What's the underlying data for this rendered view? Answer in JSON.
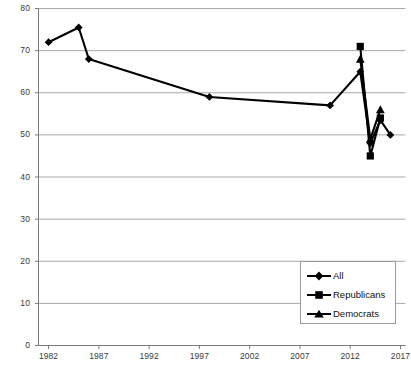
{
  "chart_data": {
    "type": "line",
    "title": "",
    "subtitle": "",
    "xlabel": "",
    "ylabel": "",
    "xlim": [
      1981.0,
      2017.5
    ],
    "ylim": [
      0,
      80
    ],
    "grid": true,
    "grid_axis": "y",
    "legend_position": "bottom-right",
    "x_ticks": [
      1982,
      1987,
      1992,
      1997,
      2002,
      2007,
      2012,
      2017
    ],
    "x_tick_labels": [
      "1982",
      "1987",
      "1992",
      "1997",
      "2002",
      "2007",
      "2012",
      "2017"
    ],
    "y_ticks": [
      0,
      10,
      20,
      30,
      40,
      50,
      60,
      70,
      80
    ],
    "y_tick_labels": [
      "0",
      "10",
      "20",
      "30",
      "40",
      "50",
      "60",
      "70",
      "80"
    ],
    "series": [
      {
        "name": "All",
        "marker": "diamond",
        "color": "#000000",
        "points": [
          {
            "x": 1982,
            "y": 72.0
          },
          {
            "x": 1985,
            "y": 75.5
          },
          {
            "x": 1986,
            "y": 68.0
          },
          {
            "x": 1998,
            "y": 59.0
          },
          {
            "x": 2010,
            "y": 57.0
          },
          {
            "x": 2013,
            "y": 65.0
          },
          {
            "x": 2014,
            "y": 48.0
          },
          {
            "x": 2015,
            "y": 53.5
          },
          {
            "x": 2016,
            "y": 50.0
          }
        ]
      },
      {
        "name": "Republicans",
        "marker": "square",
        "color": "#000000",
        "points": [
          {
            "x": 2013,
            "y": 71.0
          },
          {
            "x": 2014,
            "y": 45.0
          },
          {
            "x": 2015,
            "y": 54.0
          }
        ]
      },
      {
        "name": "Democrats",
        "marker": "triangle",
        "color": "#000000",
        "points": [
          {
            "x": 2013,
            "y": 68.0
          },
          {
            "x": 2014,
            "y": 49.0
          },
          {
            "x": 2015,
            "y": 56.0
          }
        ]
      }
    ]
  },
  "legend": {
    "entries": [
      {
        "label": "All",
        "marker": "diamond"
      },
      {
        "label": "Republicans",
        "marker": "square"
      },
      {
        "label": "Democrats",
        "marker": "triangle"
      }
    ]
  },
  "colors": {
    "series": "#000000",
    "grid": "#9e9e9e",
    "axis": "#7a7a7a",
    "background": "#ffffff",
    "tick_text": "#3a3a3a"
  }
}
